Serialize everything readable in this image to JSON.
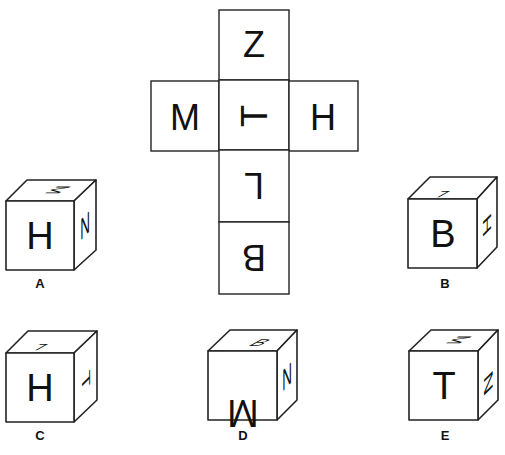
{
  "puzzle": {
    "type": "cube-net-folding",
    "net": {
      "faces": [
        {
          "id": "top",
          "letter": "Z",
          "rotation": 0,
          "mirror": false
        },
        {
          "id": "left",
          "letter": "M",
          "rotation": 0,
          "mirror": false
        },
        {
          "id": "center",
          "letter": "T",
          "rotation": 270,
          "mirror": false
        },
        {
          "id": "right",
          "letter": "H",
          "rotation": 0,
          "mirror": false
        },
        {
          "id": "below1",
          "letter": "L",
          "rotation": 180,
          "mirror": false
        },
        {
          "id": "below2",
          "letter": "B",
          "rotation": 180,
          "mirror": false
        }
      ]
    },
    "options": [
      {
        "label": "A",
        "front": "H",
        "top": "M",
        "side": "N"
      },
      {
        "label": "B",
        "front": "B",
        "top": "L",
        "side": "H"
      },
      {
        "label": "C",
        "front": "H",
        "top": "L",
        "side": "T"
      },
      {
        "label": "D",
        "front": "M",
        "top": "B",
        "side": "N"
      },
      {
        "label": "E",
        "front": "T",
        "top": "M",
        "side": "N"
      }
    ]
  }
}
